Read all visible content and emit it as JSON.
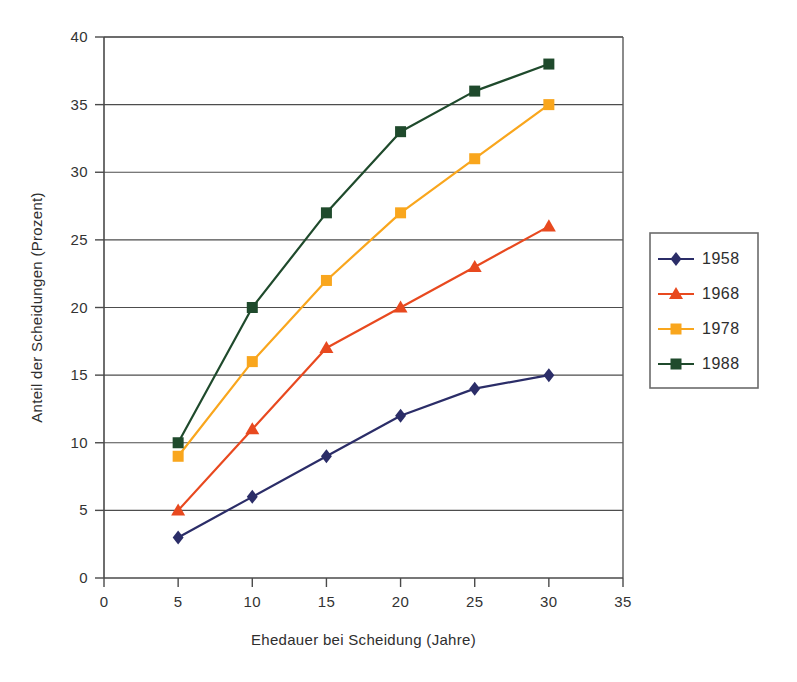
{
  "chart_data": {
    "type": "line",
    "title": "",
    "xlabel": "Ehedauer bei Scheidung (Jahre)",
    "ylabel": "Anteil der Scheidungen (Prozent)",
    "x": [
      5,
      10,
      15,
      20,
      25,
      30
    ],
    "xlim": [
      0,
      35
    ],
    "ylim": [
      0,
      40
    ],
    "xticks": [
      0,
      5,
      10,
      15,
      20,
      25,
      30,
      35
    ],
    "yticks": [
      0,
      5,
      10,
      15,
      20,
      25,
      30,
      35,
      40
    ],
    "xtick_labels": [
      "0",
      "5",
      "10",
      "15",
      "20",
      "25",
      "30",
      "35"
    ],
    "ytick_labels": [
      "0",
      "5",
      "10",
      "15",
      "20",
      "25",
      "30",
      "35",
      "40"
    ],
    "grid": "horizontal",
    "legend_position": "right",
    "series": [
      {
        "name": "1958",
        "color": "#2b2d68",
        "marker": "diamond",
        "values": [
          3,
          6,
          9,
          12,
          14,
          15
        ]
      },
      {
        "name": "1968",
        "color": "#e8491f",
        "marker": "triangle",
        "values": [
          5,
          11,
          17,
          20,
          23,
          26
        ]
      },
      {
        "name": "1978",
        "color": "#f9a61d",
        "marker": "square",
        "values": [
          9,
          16,
          22,
          27,
          31,
          35
        ]
      },
      {
        "name": "1988",
        "color": "#1f4a2c",
        "marker": "square",
        "values": [
          10,
          20,
          27,
          33,
          36,
          38
        ]
      }
    ]
  },
  "legend": {
    "entries": [
      "1958",
      "1968",
      "1978",
      "1988"
    ]
  },
  "axes": {
    "x_title": "Ehedauer bei Scheidung (Jahre)",
    "y_title": "Anteil der Scheidungen (Prozent)"
  }
}
